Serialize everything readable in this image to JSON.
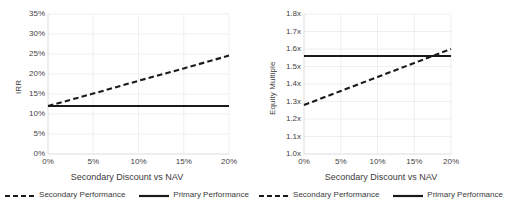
{
  "figure": {
    "panels": [
      "irr-panel",
      "equity-multiple-panel"
    ],
    "colors": {
      "line": "#1a1a1a",
      "grid": "#e8e8e8",
      "axis": "#d9d9d9",
      "text": "#3a3a3a"
    }
  },
  "legend": {
    "secondary_label": "Secondary Performance",
    "primary_label": "Primary Performance"
  },
  "chart_data": [
    {
      "type": "line",
      "id": "irr-panel",
      "title": "",
      "xlabel": "Secondary Discount vs NAV",
      "ylabel": "IRR",
      "xlim": [
        0,
        20
      ],
      "ylim": [
        0,
        35
      ],
      "grid": true,
      "legend_position": "bottom",
      "xticks": [
        0,
        5,
        10,
        15,
        20
      ],
      "xticklabels": [
        "0%",
        "5%",
        "10%",
        "15%",
        "20%"
      ],
      "yticks": [
        0,
        5,
        10,
        15,
        20,
        25,
        30,
        35
      ],
      "yticklabels": [
        "0%",
        "5%",
        "10%",
        "15%",
        "20%",
        "25%",
        "30%",
        "35%"
      ],
      "x": [
        0,
        5,
        10,
        15,
        20
      ],
      "series": [
        {
          "name": "Secondary Performance",
          "style": "dashed",
          "values": [
            12.0,
            15.1,
            18.3,
            21.4,
            24.6
          ]
        },
        {
          "name": "Primary Performance",
          "style": "solid",
          "values": [
            12.0,
            12.0,
            12.0,
            12.0,
            12.0
          ]
        }
      ]
    },
    {
      "type": "line",
      "id": "equity-multiple-panel",
      "title": "",
      "xlabel": "Secondary Discount vs NAV",
      "ylabel": "Equity Multiple",
      "xlim": [
        0,
        20
      ],
      "ylim": [
        1.0,
        1.8
      ],
      "grid": true,
      "legend_position": "bottom",
      "xticks": [
        0,
        5,
        10,
        15,
        20
      ],
      "xticklabels": [
        "0%",
        "5%",
        "10%",
        "15%",
        "20%"
      ],
      "yticks": [
        1.0,
        1.1,
        1.2,
        1.3,
        1.4,
        1.5,
        1.6,
        1.7,
        1.8
      ],
      "yticklabels": [
        "1.0x",
        "1.1x",
        "1.2x",
        "1.3x",
        "1.4x",
        "1.5x",
        "1.6x",
        "1.7x",
        "1.8x"
      ],
      "x": [
        0,
        5,
        10,
        15,
        20
      ],
      "series": [
        {
          "name": "Secondary Performance",
          "style": "dashed",
          "values": [
            1.28,
            1.36,
            1.44,
            1.52,
            1.6
          ]
        },
        {
          "name": "Primary Performance",
          "style": "solid",
          "values": [
            1.56,
            1.56,
            1.56,
            1.56,
            1.56
          ]
        }
      ]
    }
  ]
}
